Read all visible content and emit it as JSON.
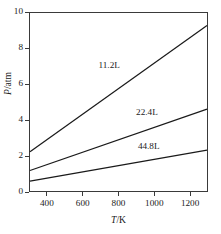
{
  "chart_data": {
    "type": "line",
    "title": "",
    "subtitle": "",
    "xlabel": "T/K",
    "ylabel": "P/atm",
    "xlabel_italic": "T",
    "xlabel_rest": "/K",
    "ylabel_italic": "P",
    "ylabel_rest": "/atm",
    "xlim": [
      300,
      1300
    ],
    "ylim": [
      0,
      10
    ],
    "grid": false,
    "legend_position": "inline-annotations",
    "xticks": [
      400,
      600,
      800,
      1000,
      1200
    ],
    "xtick_labels": [
      "400",
      "600",
      "800",
      "1000",
      "1200"
    ],
    "yticks": [
      0,
      2,
      4,
      6,
      8,
      10
    ],
    "ytick_labels": [
      "0",
      "2",
      "4",
      "6",
      "8",
      "10"
    ],
    "x": [
      300,
      1300
    ],
    "series": [
      {
        "name": "11.2L",
        "label": "11.2L",
        "values": [
          2.2,
          9.3
        ],
        "color": "#1a1a1a",
        "label_x": 800,
        "label_y": 7.05
      },
      {
        "name": "22.4L",
        "label": "22.4L",
        "values": [
          1.15,
          4.6
        ],
        "color": "#1a1a1a",
        "label_x": 1010,
        "label_y": 4.45
      },
      {
        "name": "44.8L",
        "label": "44.8L",
        "values": [
          0.55,
          2.3
        ],
        "color": "#1a1a1a",
        "label_x": 1020,
        "label_y": 2.55
      }
    ]
  },
  "caption": {
    "fragment": ""
  }
}
